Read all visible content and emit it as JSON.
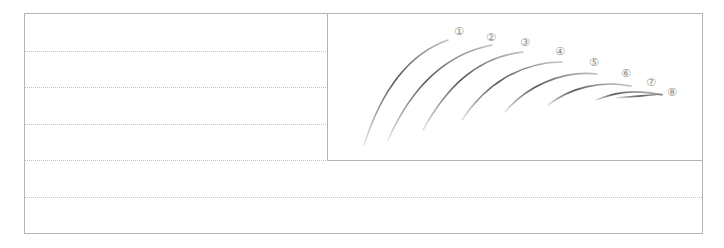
{
  "worksheet": {
    "type": "writing-practice-sheet",
    "illustration": {
      "description": "eight numbered brush-stroke arcs of decreasing height",
      "stroke_color": "#555555",
      "label_color": "#8a8a8a",
      "strokes": [
        {
          "label": "①",
          "path": "M364,145 C380,95 405,55 448,40",
          "label_x": 459,
          "label_y": 35
        },
        {
          "label": "②",
          "path": "M388,140 C408,95 440,55 492,45",
          "label_x": 491,
          "label_y": 41
        },
        {
          "label": "③",
          "path": "M423,130 C445,90 475,57 523,52",
          "label_x": 525,
          "label_y": 46
        },
        {
          "label": "④",
          "path": "M462,120 C485,85 520,62 562,62",
          "label_x": 560,
          "label_y": 55
        },
        {
          "label": "⑤",
          "path": "M505,112 C525,88 560,70 597,74",
          "label_x": 594,
          "label_y": 66
        },
        {
          "label": "⑥",
          "path": "M548,105 C570,88 600,80 631,86",
          "label_x": 626,
          "label_y": 77
        },
        {
          "label": "⑦",
          "path": "M596,100 C612,94 630,88 662,95",
          "label_x": 651,
          "label_y": 86
        },
        {
          "label": "⑧",
          "path": "M617,98 C632,97 648,95 662,94",
          "label_x": 672,
          "label_y": 96
        }
      ]
    },
    "rules": {
      "dotted_rows_y": [
        51,
        87,
        124,
        197
      ],
      "left_only_dotted_row_y": 160
    }
  }
}
